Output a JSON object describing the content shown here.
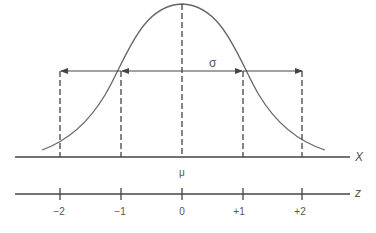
{
  "diagram": {
    "sigma_label": "σ",
    "mu_label": "μ",
    "x_axis_label": "X",
    "z_axis_label": "z",
    "z_ticks": [
      "−2",
      "−1",
      "0",
      "+1",
      "+2"
    ],
    "colors": {
      "line": "#555555",
      "background": "#ffffff"
    }
  }
}
